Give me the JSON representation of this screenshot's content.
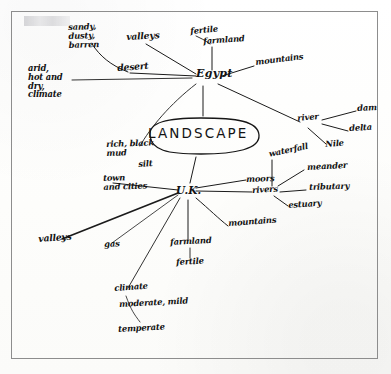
{
  "document": {
    "medium": "hand-drawn mind map on white paper, scanned",
    "border_color": "#8d8d8d",
    "ink_color": "#1b1b1b",
    "paper_color": "#fdfdfc"
  },
  "center": {
    "label": "LANDSCAPE"
  },
  "hubs": {
    "egypt": "Egypt",
    "uk": "U.K."
  },
  "branches": {
    "valleys_top": "valleys",
    "desert": "desert",
    "sandy_dusty_barren": "sandy,\ndusty,\nbarren",
    "arid_climate": "arid,\nhot and\ndry,\nclimate",
    "fertile": "fertile",
    "farmland_top": "farmland",
    "mountains_top": "mountains",
    "river": "river",
    "dam": "dam",
    "delta": "delta",
    "nile": "Nile",
    "rich_black_mud": "rich, black\nmud",
    "silt": "silt",
    "waterfall": "waterfall",
    "moors": "moors",
    "rivers": "rivers",
    "meander": "meander",
    "tributary": "tributary",
    "estuary": "estuary",
    "mountains_bottom": "mountains",
    "farmland_bottom": "farmland",
    "fertile_bottom": "fertile",
    "town_and_cities": "town\nand cities",
    "valleys_bottom": "valleys",
    "gas": "gas",
    "climate": "climate",
    "moderate_mild": "moderate, mild",
    "temperate": "temperate"
  }
}
